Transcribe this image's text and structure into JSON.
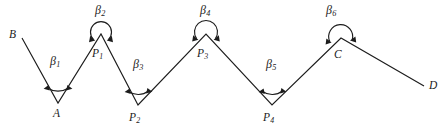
{
  "figure": {
    "type": "geometry-diagram",
    "canvas": {
      "width": 446,
      "height": 135,
      "background": "#ffffff"
    },
    "line_color": "#1c1c1c",
    "line_width": 1.15,
    "path_order": [
      "B",
      "A",
      "P1",
      "P2",
      "P3",
      "P4",
      "C",
      "D"
    ],
    "vertices": [
      {
        "id": "B",
        "label": "B",
        "x": 22,
        "y": 38,
        "kind": "endpoint",
        "label_x": 9,
        "label_y": 29
      },
      {
        "id": "A",
        "label": "A",
        "x": 58,
        "y": 103,
        "kind": "valley",
        "label_x": 53,
        "label_y": 108
      },
      {
        "id": "P1",
        "label": "P",
        "sub": "1",
        "x": 101,
        "y": 34,
        "kind": "peak",
        "label_x": 92,
        "label_y": 48
      },
      {
        "id": "P2",
        "label": "P",
        "sub": "2",
        "x": 138,
        "y": 105,
        "kind": "valley",
        "label_x": 129,
        "label_y": 112
      },
      {
        "id": "P3",
        "label": "P",
        "sub": "3",
        "x": 206,
        "y": 34,
        "kind": "peak",
        "label_x": 197,
        "label_y": 48
      },
      {
        "id": "P4",
        "label": "P",
        "sub": "4",
        "x": 272,
        "y": 105,
        "kind": "valley",
        "label_x": 263,
        "label_y": 112
      },
      {
        "id": "C",
        "label": "C",
        "x": 341,
        "y": 38,
        "kind": "peak",
        "label_x": 334,
        "label_y": 49
      },
      {
        "id": "D",
        "label": "D",
        "x": 424,
        "y": 86,
        "kind": "endpoint",
        "label_x": 429,
        "label_y": 80
      }
    ],
    "angles": [
      {
        "id": "beta1",
        "label": "β",
        "sub": "1",
        "at": "A",
        "arc_kind": "interior-small",
        "label_x": 50,
        "label_y": 55
      },
      {
        "id": "beta2",
        "label": "β",
        "sub": "2",
        "at": "P1",
        "arc_kind": "reflex-over",
        "label_x": 95,
        "label_y": 4
      },
      {
        "id": "beta3",
        "label": "β",
        "sub": "3",
        "at": "P2",
        "arc_kind": "interior-small",
        "label_x": 133,
        "label_y": 58
      },
      {
        "id": "beta4",
        "label": "β",
        "sub": "4",
        "at": "P3",
        "arc_kind": "reflex-over",
        "label_x": 200,
        "label_y": 4
      },
      {
        "id": "beta5",
        "label": "β",
        "sub": "5",
        "at": "P4",
        "arc_kind": "interior-small",
        "label_x": 266,
        "label_y": 58
      },
      {
        "id": "beta6",
        "label": "β",
        "sub": "6",
        "at": "C",
        "arc_kind": "reflex-over",
        "label_x": 326,
        "label_y": 4
      }
    ]
  }
}
